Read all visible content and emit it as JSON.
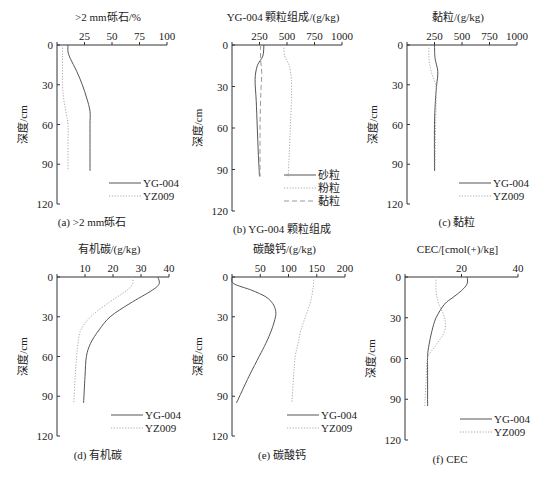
{
  "common": {
    "ylabel": "深度/cm",
    "y_ticks": [
      0,
      30,
      60,
      90,
      120
    ],
    "ylim": [
      0,
      120
    ],
    "colors": {
      "YG-004": "#555555",
      "YZ009": "#bbbbbb"
    }
  },
  "chart_data": [
    {
      "id": "a",
      "type": "line",
      "title": ">2 mm砾石/%",
      "caption": "(a) >2 mm砾石",
      "xlabel": ">2 mm砾石/%",
      "ylabel": "深度/cm",
      "x_ticks": [
        0,
        25,
        50,
        75,
        100
      ],
      "x_tick_labels": [
        "",
        "25",
        "50",
        "75",
        "100"
      ],
      "xlim": [
        0,
        100
      ],
      "ylim": [
        0,
        120
      ],
      "legend": [
        "YG-004",
        "YZ009"
      ],
      "series": [
        {
          "name": "YG-004",
          "style": "solid",
          "depth": [
            0,
            5,
            10,
            20,
            30,
            40,
            50,
            60,
            75,
            95
          ],
          "values": [
            10,
            10,
            12,
            18,
            23,
            27,
            30,
            30,
            30,
            30
          ]
        },
        {
          "name": "YZ009",
          "style": "dotted",
          "depth": [
            0,
            10,
            30,
            40,
            50,
            60,
            75,
            95
          ],
          "values": [
            5,
            5,
            5,
            6,
            8,
            10,
            10,
            10
          ]
        }
      ]
    },
    {
      "id": "b",
      "type": "line",
      "title": "YG-004 颗粒组成/(g/kg)",
      "caption": "(b) YG-004 颗粒组成",
      "xlabel": "YG-004 颗粒组成/(g/kg)",
      "ylabel": "深度/cm",
      "x_ticks": [
        0,
        250,
        500,
        750,
        1000
      ],
      "x_tick_labels": [
        "",
        "250",
        "500",
        "750",
        "1000"
      ],
      "xlim": [
        0,
        1000
      ],
      "ylim": [
        0,
        120
      ],
      "legend": [
        "砂粒",
        "粉粒",
        "黏粒"
      ],
      "series": [
        {
          "name": "砂粒",
          "style": "solid",
          "depth": [
            0,
            8,
            15,
            25,
            40,
            60,
            80,
            95
          ],
          "values": [
            290,
            280,
            230,
            210,
            220,
            230,
            240,
            250
          ]
        },
        {
          "name": "粉粒",
          "style": "dotted",
          "depth": [
            0,
            8,
            15,
            25,
            40,
            60,
            80,
            95
          ],
          "values": [
            470,
            480,
            520,
            540,
            540,
            530,
            520,
            510
          ]
        },
        {
          "name": "黏粒",
          "style": "dashed",
          "depth": [
            0,
            10,
            20,
            30,
            40,
            60,
            95
          ],
          "values": [
            260,
            260,
            270,
            265,
            260,
            255,
            255
          ]
        }
      ]
    },
    {
      "id": "c",
      "type": "line",
      "title": "黏粒/(g/kg)",
      "caption": "(c) 黏粒",
      "xlabel": "黏粒/(g/kg)",
      "ylabel": "深度/cm",
      "x_ticks": [
        0,
        250,
        500,
        750,
        1000
      ],
      "x_tick_labels": [
        "",
        "250",
        "500",
        "750",
        "1000"
      ],
      "xlim": [
        0,
        1000
      ],
      "ylim": [
        0,
        120
      ],
      "legend": [
        "YG-004",
        "YZ009"
      ],
      "series": [
        {
          "name": "YG-004",
          "style": "solid",
          "depth": [
            0,
            10,
            20,
            30,
            40,
            60,
            95
          ],
          "values": [
            250,
            255,
            280,
            270,
            260,
            250,
            250
          ]
        },
        {
          "name": "YZ009",
          "style": "dotted",
          "depth": [
            0,
            10,
            20,
            30,
            40,
            60,
            95
          ],
          "values": [
            200,
            200,
            220,
            260,
            265,
            260,
            255
          ]
        }
      ]
    },
    {
      "id": "d",
      "type": "line",
      "title": "有机碳/(g/kg)",
      "caption": "(d) 有机碳",
      "xlabel": "有机碳/(g/kg)",
      "ylabel": "深度/cm",
      "x_ticks": [
        0,
        10,
        20,
        30,
        40
      ],
      "x_tick_labels": [
        "",
        "10",
        "20",
        "30",
        "40"
      ],
      "xlim": [
        0,
        40
      ],
      "ylim": [
        0,
        120
      ],
      "legend": [
        "YG-004",
        "YZ009"
      ],
      "series": [
        {
          "name": "YG-004",
          "style": "solid",
          "depth": [
            0,
            5,
            10,
            20,
            30,
            40,
            50,
            60,
            75,
            95
          ],
          "values": [
            36,
            36.5,
            34,
            26,
            19,
            15,
            12,
            10.5,
            10,
            9.5
          ]
        },
        {
          "name": "YZ009",
          "style": "dotted",
          "depth": [
            0,
            5,
            10,
            20,
            30,
            40,
            50,
            60,
            75,
            95
          ],
          "values": [
            27,
            27,
            25,
            18,
            12,
            8.5,
            7.5,
            7,
            6.5,
            6
          ]
        }
      ]
    },
    {
      "id": "e",
      "type": "line",
      "title": "碳酸钙/(g/kg)",
      "caption": "(e) 碳酸钙",
      "xlabel": "碳酸钙/(g/kg)",
      "ylabel": "深度/cm",
      "x_ticks": [
        0,
        50,
        100,
        150,
        200
      ],
      "x_tick_labels": [
        "",
        "50",
        "100",
        "150",
        "200"
      ],
      "xlim": [
        0,
        200
      ],
      "ylim": [
        0,
        120
      ],
      "legend": [
        "YG-004",
        "YZ009"
      ],
      "series": [
        {
          "name": "YG-004",
          "style": "solid",
          "depth": [
            0,
            5,
            10,
            15,
            20,
            25,
            30,
            40,
            50,
            60,
            75,
            95
          ],
          "values": [
            0,
            3,
            35,
            60,
            72,
            77,
            77,
            70,
            60,
            48,
            30,
            8
          ]
        },
        {
          "name": "YZ009",
          "style": "dotted",
          "depth": [
            0,
            10,
            20,
            30,
            40,
            50,
            60,
            75,
            95
          ],
          "values": [
            145,
            143,
            138,
            130,
            122,
            117,
            112,
            109,
            106
          ]
        }
      ]
    },
    {
      "id": "f",
      "type": "line",
      "title": "CEC/[cmol(+)/kg]",
      "caption": "(f) CEC",
      "xlabel": "CEC/[cmol(+)/kg]",
      "ylabel": "深度/cm",
      "x_ticks": [
        0,
        20,
        40
      ],
      "x_tick_labels": [
        "",
        "20",
        "40"
      ],
      "xlim": [
        0,
        40
      ],
      "ylim": [
        0,
        120
      ],
      "legend": [
        "YG-004",
        "YZ009"
      ],
      "series": [
        {
          "name": "YG-004",
          "style": "solid",
          "depth": [
            0,
            5,
            10,
            15,
            20,
            30,
            40,
            50,
            58,
            70,
            95
          ],
          "values": [
            22,
            22,
            20,
            17,
            14,
            11,
            9.5,
            8.5,
            8,
            8,
            8
          ]
        },
        {
          "name": "YZ009",
          "style": "dotted",
          "depth": [
            0,
            10,
            20,
            30,
            40,
            50,
            60,
            75,
            95
          ],
          "values": [
            11,
            11,
            12,
            14,
            14,
            11,
            8,
            7.5,
            7
          ]
        }
      ]
    }
  ]
}
